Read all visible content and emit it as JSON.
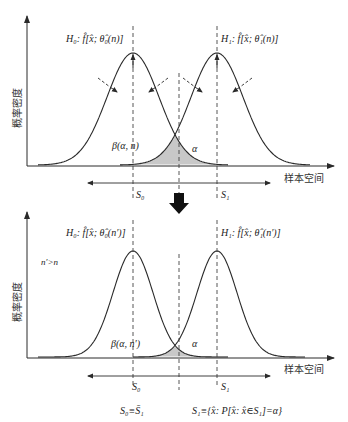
{
  "diagram": {
    "type": "hypothesis-test-density-illustration",
    "arrow_between_panels": "down-arrow",
    "colors": {
      "line": "#2a2a2a",
      "shade": "#c8c8c8",
      "dashed": "#444444"
    },
    "panels": [
      {
        "id": "top",
        "y_axis_label": "概率密度",
        "x_axis_label": "样本空间",
        "h0_label": "H₀: f̂[x̂;  θ̂₀(n)]",
        "h1_label": "H₁: f̂[x̂;  θ̂₁(n)]",
        "beta_label": "β(α,  n)",
        "alpha_label": "α",
        "region_s0_label": "S₀",
        "region_s1_label": "S₁",
        "note": ""
      },
      {
        "id": "bottom",
        "y_axis_label": "概率密度",
        "x_axis_label": "样本空间",
        "h0_label": "H₀: f̂[x̂;  θ̂₀(n′)]",
        "h1_label": "H₁: f̂[x̂;  θ̂₁(n′)]",
        "beta_label": "β(α,  n′)",
        "alpha_label": "α",
        "region_s0_label": "S₀",
        "region_s1_label": "S₁",
        "note": "n′>n"
      }
    ],
    "formulas": {
      "s0_def": "S₀≡S̄₁",
      "s1_def": "S₁≡{x̂: P[x̂: x̂∈S₁]=α}"
    }
  }
}
